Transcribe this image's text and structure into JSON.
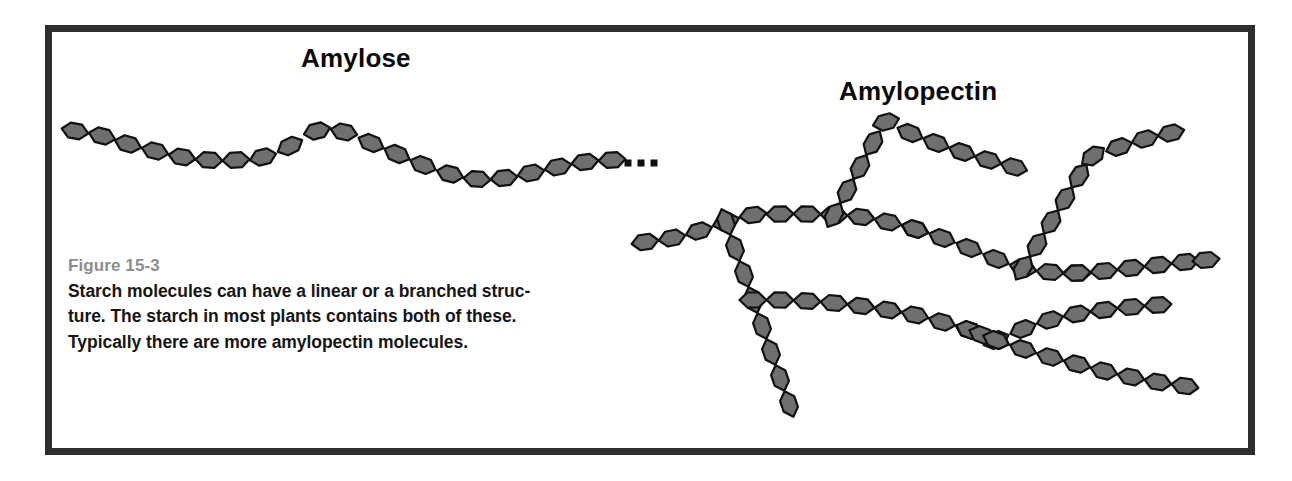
{
  "figure": {
    "background_color": "#ffffff",
    "frame_color": "#2e2e2e",
    "unit_fill_color": "#6f6f6f",
    "unit_stroke_color": "#111111",
    "label_color": "#8d8d8d",
    "text_color": "#151515"
  },
  "titles": {
    "amylose": "Amylose",
    "amylopectin": "Amylopectin"
  },
  "caption": {
    "label": "Figure 15-3",
    "line1": "Starch molecules can have a linear or a branched struc-",
    "line2": "ture. The starch in most plants contains both of these.",
    "line3": "Typically there are more amylopectin molecules.",
    "full_text": "Starch molecules can have a linear or a branched structure. The starch in most plants contains both of these. Typically there are more amylopectin molecules."
  },
  "chart_data": {
    "type": "diagram",
    "subtitle": "Figure 15-3",
    "legend": [
      "Amylose",
      "Amylopectin"
    ],
    "glyph": {
      "shape": "hexagon",
      "meaning": "glucose unit",
      "length": 27,
      "height": 15,
      "fill": "#6f6f6f",
      "stroke": "#111111",
      "stroke_width": 2.2
    },
    "structures": [
      {
        "name": "amylose",
        "label": "Amylose",
        "description": "linear unbranched chain of glucose units drawn as a gentle wave",
        "unit_count": 21,
        "terminator": "ellipsis",
        "chains": [
          {
            "id": "amylose-main",
            "units": 21,
            "points": [
              [
                75,
                131
              ],
              [
                102,
                136
              ],
              [
                128,
                144
              ],
              [
                155,
                151
              ],
              [
                182,
                157
              ],
              [
                209,
                160
              ],
              [
                236,
                160
              ],
              [
                263,
                157
              ],
              [
                290,
                146
              ],
              [
                317,
                131
              ],
              [
                344,
                132
              ],
              [
                371,
                143
              ],
              [
                397,
                154
              ],
              [
                423,
                165
              ],
              [
                450,
                174
              ],
              [
                477,
                179
              ],
              [
                504,
                178
              ],
              [
                531,
                173
              ],
              [
                558,
                167
              ],
              [
                585,
                162
              ],
              [
                612,
                160
              ]
            ]
          }
        ],
        "ellipsis": {
          "dots": 3,
          "size": 7,
          "positions": [
            [
              628,
              163
            ],
            [
              641,
              163
            ],
            [
              654,
              163
            ]
          ]
        }
      },
      {
        "name": "amylopectin",
        "label": "Amylopectin",
        "description": "branched chain of glucose units with multiple branch points",
        "unit_count": 59,
        "branch_points": 5,
        "chains": [
          {
            "id": "backbone-left",
            "units": 11,
            "points": [
              [
                645,
                242
              ],
              [
                672,
                238
              ],
              [
                699,
                231
              ],
              [
                726,
                222
              ],
              [
                753,
                215
              ],
              [
                780,
                214
              ],
              [
                807,
                214
              ],
              [
                834,
                215
              ],
              [
                861,
                217
              ],
              [
                888,
                222
              ],
              [
                915,
                229
              ]
            ]
          },
          {
            "id": "branch-left-down",
            "units": 8,
            "points": [
              [
                726,
                222
              ],
              [
                735,
                248
              ],
              [
                744,
                274
              ],
              [
                753,
                300
              ],
              [
                762,
                326
              ],
              [
                771,
                352
              ],
              [
                780,
                378
              ],
              [
                789,
                404
              ]
            ]
          },
          {
            "id": "branch-mid-up",
            "units": 10,
            "points": [
              [
                834,
                215
              ],
              [
                847,
                191
              ],
              [
                860,
                167
              ],
              [
                873,
                143
              ],
              [
                886,
                122
              ],
              [
                910,
                133
              ],
              [
                936,
                143
              ],
              [
                962,
                152
              ],
              [
                988,
                160
              ],
              [
                1014,
                167
              ]
            ]
          },
          {
            "id": "backbone-right",
            "units": 7,
            "points": [
              [
                915,
                229
              ],
              [
                942,
                238
              ],
              [
                969,
                248
              ],
              [
                996,
                259
              ],
              [
                1023,
                268
              ],
              [
                1050,
                272
              ],
              [
                1077,
                273
              ]
            ]
          },
          {
            "id": "branch-right-up",
            "units": 9,
            "points": [
              [
                1023,
                268
              ],
              [
                1037,
                245
              ],
              [
                1051,
                222
              ],
              [
                1065,
                199
              ],
              [
                1079,
                176
              ],
              [
                1093,
                156
              ],
              [
                1119,
                147
              ],
              [
                1145,
                139
              ],
              [
                1171,
                133
              ]
            ]
          },
          {
            "id": "branch-right-mid",
            "units": 6,
            "points": [
              [
                1077,
                273
              ],
              [
                1104,
                271
              ],
              [
                1131,
                268
              ],
              [
                1158,
                265
              ],
              [
                1185,
                262
              ],
              [
                1206,
                260
              ]
            ]
          },
          {
            "id": "branch-lower-left",
            "units": 9,
            "points": [
              [
                753,
                300
              ],
              [
                780,
                300
              ],
              [
                807,
                301
              ],
              [
                834,
                303
              ],
              [
                861,
                306
              ],
              [
                888,
                310
              ],
              [
                915,
                315
              ],
              [
                942,
                322
              ],
              [
                969,
                330
              ]
            ]
          },
          {
            "id": "branch-lower-right-up",
            "units": 7,
            "points": [
              [
                996,
                340
              ],
              [
                1023,
                329
              ],
              [
                1050,
                320
              ],
              [
                1077,
                314
              ],
              [
                1104,
                310
              ],
              [
                1131,
                307
              ],
              [
                1158,
                305
              ]
            ]
          },
          {
            "id": "branch-lower-right-down",
            "units": 8,
            "points": [
              [
                996,
                340
              ],
              [
                1023,
                349
              ],
              [
                1050,
                357
              ],
              [
                1077,
                364
              ],
              [
                1104,
                371
              ],
              [
                1131,
                377
              ],
              [
                1158,
                382
              ],
              [
                1185,
                386
              ]
            ]
          },
          {
            "id": "branch-lower-connector",
            "units": 3,
            "points": [
              [
                969,
                330
              ],
              [
                982,
                335
              ],
              [
                996,
                340
              ]
            ]
          }
        ]
      }
    ]
  }
}
